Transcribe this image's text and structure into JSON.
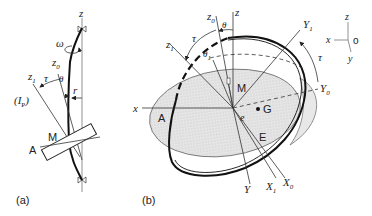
{
  "figure": {
    "panel_a": {
      "label": "(a)",
      "axis_z": "z",
      "axis_z0": "z",
      "axis_z0_sub": "0",
      "axis_z1": "z",
      "axis_z1_sub": "1",
      "omega": "ω",
      "tau": "τ",
      "theta": "θ",
      "r": "r",
      "principal_axis": "(I",
      "principal_axis_sub": "P",
      "principal_axis_close": ")",
      "point_M": "M",
      "point_A": "A"
    },
    "panel_b": {
      "label": "(b)",
      "axis_z": "z",
      "axis_z0": "z",
      "axis_z0_sub": "0",
      "axis_z1": "z",
      "axis_z1_sub": "1",
      "theta": "θ",
      "theta1": "θ",
      "theta1_sub": "1",
      "tau_left": "τ",
      "tau_right": "τ",
      "point_M": "M",
      "point_G": "G",
      "point_A": "A",
      "point_E": "E",
      "e": "e",
      "axis_x": "x",
      "axis_Y": "Y",
      "axis_Y0": "Y",
      "axis_Y0_sub": "0",
      "axis_Y1": "Y",
      "axis_Y1_sub": "1",
      "axis_X0": "X",
      "axis_X0_sub": "0",
      "axis_X1": "X",
      "axis_X1_sub": "1"
    },
    "coordinate_legend": {
      "z": "z",
      "x": "x",
      "y": "y",
      "o": "o"
    }
  }
}
